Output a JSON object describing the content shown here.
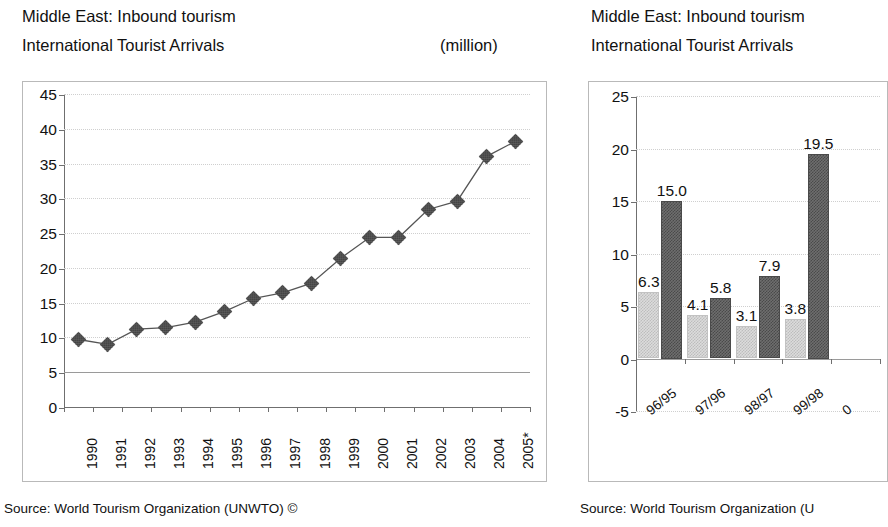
{
  "left": {
    "title_line1": "Middle East: Inbound tourism",
    "title_line2": "International Tourist Arrivals",
    "unit": "(million)",
    "source": "Source: World Tourism Organization (UNWTO) ©"
  },
  "right": {
    "title_line1": "Middle East: Inbound tourism",
    "title_line2": "International Tourist Arrivals",
    "source": "Source: World Tourism Organization (U"
  },
  "chart_data": [
    {
      "type": "line",
      "title": "Middle East: Inbound tourism — International Tourist Arrivals",
      "xlabel": "",
      "ylabel": "(million)",
      "ylim": [
        0,
        45
      ],
      "yticks": [
        0,
        5,
        10,
        15,
        20,
        25,
        30,
        35,
        40,
        45
      ],
      "grid": true,
      "legend": "none",
      "categories": [
        "1990",
        "1991",
        "1992",
        "1993",
        "1994",
        "1995",
        "1996",
        "1997",
        "1998",
        "1999",
        "2000",
        "2001",
        "2002",
        "2003",
        "2004",
        "2005*"
      ],
      "values": [
        9.7,
        9.0,
        11.2,
        11.4,
        12.2,
        13.7,
        15.6,
        16.4,
        17.8,
        21.4,
        24.4,
        24.4,
        28.4,
        29.6,
        36.0,
        38.2
      ],
      "marker": "diamond"
    },
    {
      "type": "bar",
      "title": "Middle East: Inbound tourism — International Tourist Arrivals",
      "xlabel": "",
      "ylabel": "",
      "ylim": [
        -5,
        25
      ],
      "yticks": [
        -5,
        0,
        5,
        10,
        15,
        20,
        25
      ],
      "grid": true,
      "legend": "none",
      "note": "right chart is cropped at the image edge; a fifth category is only partly visible",
      "categories": [
        "96/95",
        "97/96",
        "98/97",
        "99/98"
      ],
      "series": [
        {
          "name": "light",
          "values": [
            6.3,
            4.1,
            3.1,
            3.8
          ],
          "color": "#dcdcdc"
        },
        {
          "name": "dark",
          "values": [
            15.0,
            5.8,
            7.9,
            19.5
          ],
          "color": "#6e6e6e"
        }
      ],
      "data_labels": [
        "6.3",
        "15.0",
        "4.1",
        "5.8",
        "3.1",
        "7.9",
        "3.8",
        "19.5"
      ]
    }
  ]
}
